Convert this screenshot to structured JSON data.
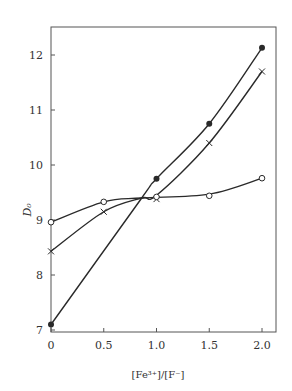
{
  "chart_data": {
    "type": "line",
    "title": "",
    "xlabel": "[Fe³⁺]/[F⁻]",
    "ylabel": "D₀",
    "xlim": [
      0,
      2.1
    ],
    "ylim": [
      6.8,
      12.5
    ],
    "xticks": [
      0,
      0.5,
      1.0,
      1.5,
      2.0
    ],
    "xtick_labels": [
      "0",
      "0.5",
      "1.0",
      "1.5",
      "2.0"
    ],
    "yticks": [
      7,
      8,
      9,
      10,
      11,
      12
    ],
    "ytick_labels": [
      "7",
      "8",
      "9",
      "10",
      "11",
      "12"
    ],
    "grid": false,
    "legend": "none",
    "x": [
      0,
      0.5,
      1.0,
      1.5,
      2.0
    ],
    "series": [
      {
        "name": "filled-circle",
        "marker": "filled-circle",
        "x": [
          0,
          1.0,
          1.5,
          2.0
        ],
        "values": [
          7.1,
          9.75,
          10.75,
          12.13
        ]
      },
      {
        "name": "cross",
        "marker": "cross",
        "x": [
          0,
          0.5,
          1.0,
          1.5,
          2.0
        ],
        "values": [
          8.43,
          9.15,
          9.38,
          10.4,
          11.7
        ]
      },
      {
        "name": "open-circle",
        "marker": "open-circle",
        "x": [
          0,
          0.5,
          1.0,
          1.5,
          2.0
        ],
        "values": [
          8.96,
          9.33,
          9.42,
          9.44,
          9.76
        ]
      }
    ],
    "intersection_point": {
      "x": 0.86,
      "y": 9.4
    }
  },
  "colors": {
    "line": "#2a2a2a",
    "frame": "#555555",
    "background": "#ffffff"
  }
}
